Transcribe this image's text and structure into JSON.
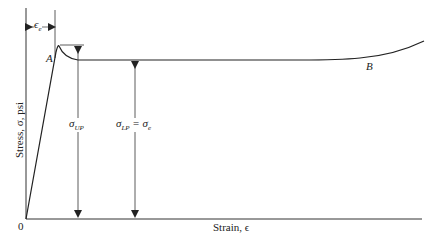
{
  "diagram": {
    "type": "stress-strain curve with upper and lower yield points",
    "y_axis_label": "Stress, σ, psi",
    "x_axis_label": "Strain, ϵ",
    "origin_label": "0",
    "point_a_label": "A",
    "point_b_label": "B",
    "elastic_strain_label": "ϵ",
    "elastic_strain_sub": "e",
    "upper_yield_label": "σ",
    "upper_yield_sub": "UP",
    "lower_yield_label": "σ",
    "lower_yield_sub": "LP",
    "lower_yield_eq": " = σ",
    "lower_yield_eq_sub": "e",
    "colors": {
      "line": "#222222",
      "background": "#ffffff"
    }
  }
}
